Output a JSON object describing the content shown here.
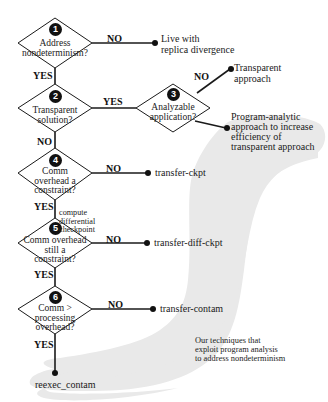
{
  "colors": {
    "line": "#1a1a1a",
    "region": "#e9e9e9",
    "background": "#ffffff"
  },
  "decisions": [
    {
      "number": "1",
      "question": [
        "Address",
        "nondeterminism?"
      ]
    },
    {
      "number": "2",
      "question": [
        "Transparent",
        "solution?"
      ]
    },
    {
      "number": "3",
      "question": [
        "Analyzable",
        "application?"
      ]
    },
    {
      "number": "4",
      "question": [
        "Comm",
        "overhead a",
        "constraint?"
      ]
    },
    {
      "number": "5",
      "question": [
        "Comm overhead",
        "still a",
        "constraint?"
      ]
    },
    {
      "number": "6",
      "question": [
        "Comm >",
        "processing",
        "overhead?"
      ]
    }
  ],
  "edge_labels": {
    "d1_no": "NO",
    "d1_yes": "YES",
    "d2_yes": "YES",
    "d2_no": "NO",
    "d3_no": "NO",
    "d4_no": "NO",
    "d4_yes": "YES",
    "d4_yes_note": [
      "compute",
      "differential",
      "checkpoint"
    ],
    "d5_no": "NO",
    "d5_yes": "YES",
    "d6_no": "NO",
    "d6_yes": "YES"
  },
  "outcomes": {
    "live_with_divergence": [
      "Live with",
      "replica divergence"
    ],
    "transparent_approach": [
      "Transparent",
      "approach"
    ],
    "program_analytic": [
      "Program-analytic",
      "approach to increase",
      "efficiency of",
      "transparent approach"
    ],
    "transfer_ckpt": "transfer-ckpt",
    "transfer_diff_ckpt": "transfer-diff-ckpt",
    "transfer_contam": "transfer-contam",
    "reexec_contam": "reexec_contam"
  },
  "region_caption": [
    "Our techniques that",
    "exploit program analysis",
    "to address nondeterminism"
  ]
}
